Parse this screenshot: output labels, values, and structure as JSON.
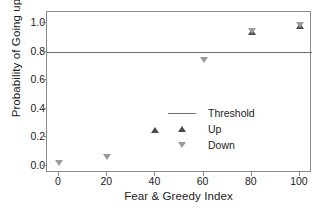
{
  "chart_data": {
    "type": "scatter",
    "title": "",
    "xlabel": "Fear & Greedy Index",
    "ylabel": "Probability of Going up",
    "xlim": [
      -5,
      105
    ],
    "ylim": [
      -0.05,
      1.08
    ],
    "xticks": [
      0,
      20,
      40,
      60,
      80,
      100
    ],
    "xtick_labels": [
      "0",
      "20",
      "40",
      "60",
      "80",
      "100"
    ],
    "yticks": [
      0.0,
      0.2,
      0.4,
      0.6,
      0.8,
      1.0
    ],
    "ytick_labels": [
      "0.0",
      "0.2",
      "0.4",
      "0.6",
      "0.8",
      "1.0"
    ],
    "grid": false,
    "legend_position": "center-right",
    "threshold": {
      "value": 0.8,
      "label": "Threshold",
      "color": "#6f6f6f"
    },
    "series": [
      {
        "name": "Up",
        "marker": "triangle-up",
        "color": "#4a4a4a",
        "points": [
          {
            "x": 40,
            "y": 0.25
          },
          {
            "x": 80,
            "y": 0.94
          },
          {
            "x": 100,
            "y": 0.98
          }
        ]
      },
      {
        "name": "Down",
        "marker": "triangle-down",
        "color": "#9a9a9a",
        "points": [
          {
            "x": 0,
            "y": 0.02
          },
          {
            "x": 20,
            "y": 0.06
          },
          {
            "x": 60,
            "y": 0.74
          },
          {
            "x": 80,
            "y": 0.95
          },
          {
            "x": 100,
            "y": 0.99
          }
        ]
      }
    ]
  },
  "legend": {
    "items": [
      {
        "label": "Threshold",
        "kind": "line"
      },
      {
        "label": "Up",
        "kind": "triangle-up"
      },
      {
        "label": "Down",
        "kind": "triangle-down"
      }
    ]
  },
  "colors": {
    "axis": "#8a8a8a",
    "text": "#1c1c1c",
    "background": "#ffffff"
  }
}
